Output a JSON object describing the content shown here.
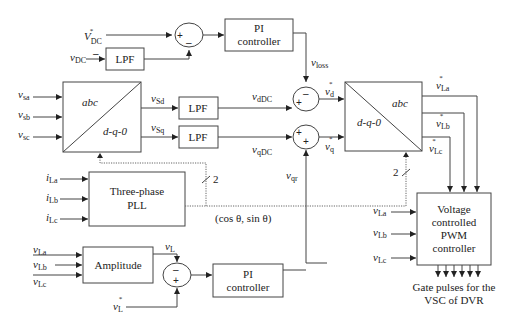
{
  "diagram": {
    "blocks": {
      "lpf_dc": "LPF",
      "pi_top": [
        "PI",
        "controller"
      ],
      "abc_dq0_left": {
        "top": "abc",
        "bottom": "d-q-0"
      },
      "lpf_d": "LPF",
      "lpf_q": "LPF",
      "dq0_abc_right": {
        "top": "abc",
        "bottom": "d-q-0"
      },
      "pll": [
        "Three-phase",
        "PLL"
      ],
      "amplitude": "Amplitude",
      "pi_bottom": [
        "PI",
        "controller"
      ],
      "pwm": [
        "Voltage",
        "controlled",
        "PWM",
        "controller"
      ]
    },
    "signals": {
      "vdc_ref": {
        "base": "V",
        "sub": "DC",
        "sup": "*"
      },
      "vdc": {
        "base": "v",
        "sub": "DC"
      },
      "vsa": {
        "base": "v",
        "sub": "sa"
      },
      "vsb": {
        "base": "v",
        "sub": "sb"
      },
      "vsc": {
        "base": "v",
        "sub": "sc"
      },
      "vsd": {
        "base": "v",
        "sub": "Sd"
      },
      "vsq": {
        "base": "v",
        "sub": "Sq"
      },
      "vddc": {
        "base": "v",
        "sub": "dDC"
      },
      "vqdc": {
        "base": "v",
        "sub": "qDC"
      },
      "vloss": {
        "base": "v",
        "sub": "loss"
      },
      "vd_ref": {
        "base": "v",
        "sub": "d",
        "sup": "*"
      },
      "vq_ref": {
        "base": "v",
        "sub": "q",
        "sup": "*"
      },
      "vqr": {
        "base": "v",
        "sub": "qr"
      },
      "vLa_ref": {
        "base": "v",
        "sub": "La",
        "sup": "*"
      },
      "vLb_ref": {
        "base": "v",
        "sub": "Lb",
        "sup": "*"
      },
      "vLc_ref": {
        "base": "v",
        "sub": "Lc",
        "sup": "*"
      },
      "iLa": {
        "base": "i",
        "sub": "La"
      },
      "iLb": {
        "base": "i",
        "sub": "Lb"
      },
      "iLc": {
        "base": "i",
        "sub": "Lc"
      },
      "vLa": {
        "base": "v",
        "sub": "La"
      },
      "vLb": {
        "base": "v",
        "sub": "Lb"
      },
      "vLc": {
        "base": "v",
        "sub": "Lc"
      },
      "vLa_pwm": {
        "base": "v",
        "sub": "La"
      },
      "vLb_pwm": {
        "base": "v",
        "sub": "Lb"
      },
      "vLc_pwm": {
        "base": "v",
        "sub": "Lc"
      },
      "vL": {
        "base": "v",
        "sub": "L"
      },
      "vL_ref": {
        "base": "v",
        "sub": "L",
        "sup": "*"
      }
    },
    "annotations": {
      "cos_sin": "(cos θ, sin θ)",
      "bus_width_1": "2",
      "bus_width_2": "2",
      "gate_pulses": [
        "Gate pulses for the",
        "VSC of DVR"
      ]
    },
    "signs": {
      "sum_top": [
        "+",
        "–"
      ],
      "sum_d": [
        "–",
        "+"
      ],
      "sum_q": [
        "+",
        "+"
      ],
      "sum_amp": [
        "–",
        "+"
      ],
      "vdc_minus": "–"
    }
  }
}
